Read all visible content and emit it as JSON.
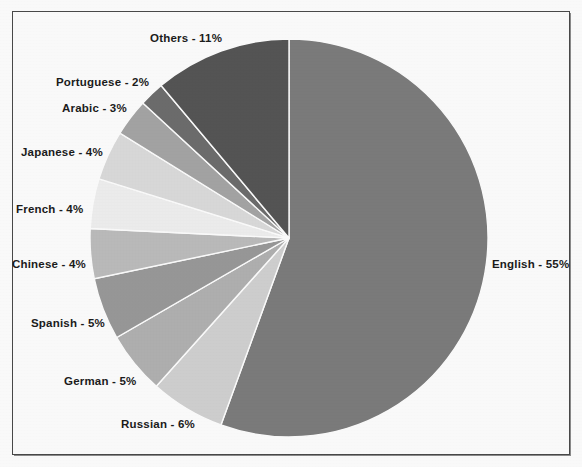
{
  "chart_data": {
    "type": "pie",
    "title": "",
    "subtitle": "",
    "xlabel": "",
    "ylabel": "",
    "legend_position": "none",
    "grid": false,
    "unit": "%",
    "start_angle_deg": 0,
    "direction": "clockwise",
    "categories": [
      "English",
      "Russian",
      "German",
      "Spanish",
      "Chinese",
      "French",
      "Japanese",
      "Arabic",
      "Portuguese",
      "Others"
    ],
    "values": [
      55,
      6,
      5,
      5,
      4,
      4,
      4,
      3,
      2,
      11
    ],
    "slices": [
      {
        "name": "English",
        "value": 55,
        "label": "English - 55%",
        "color": "#7d7d7d",
        "label_x": 492,
        "label_y": 258
      },
      {
        "name": "Russian",
        "value": 6,
        "label": "Russian - 6%",
        "color": "#d2d2d2",
        "label_x": 121,
        "label_y": 418
      },
      {
        "name": "German",
        "value": 5,
        "label": "German - 5%",
        "color": "#b2b2b2",
        "label_x": 64,
        "label_y": 375
      },
      {
        "name": "Spanish",
        "value": 5,
        "label": "Spanish - 5%",
        "color": "#9a9a9a",
        "label_x": 31,
        "label_y": 317
      },
      {
        "name": "Chinese",
        "value": 4,
        "label": "Chinese - 4%",
        "color": "#bdbdbd",
        "label_x": 12,
        "label_y": 258
      },
      {
        "name": "French",
        "value": 4,
        "label": "French  - 4%",
        "color": "#f0f0f0",
        "label_x": 16,
        "label_y": 203
      },
      {
        "name": "Japanese",
        "value": 4,
        "label": "Japanese  - 4%",
        "color": "#dcdcdc",
        "label_x": 21,
        "label_y": 146
      },
      {
        "name": "Arabic",
        "value": 3,
        "label": "Arabic - 3%",
        "color": "#a6a6a6",
        "label_x": 62,
        "label_y": 102
      },
      {
        "name": "Portuguese",
        "value": 2,
        "label": "Portuguese - 2%",
        "color": "#6e6e6e",
        "label_x": 56,
        "label_y": 76
      },
      {
        "name": "Others",
        "value": 11,
        "label": "Others - 11%",
        "color": "#565656",
        "label_x": 150,
        "label_y": 32
      }
    ],
    "geometry": {
      "cx": 289,
      "cy": 238,
      "r": 199
    }
  },
  "figure": {
    "background_color": "#ffffff",
    "border_color": "#4a4a4a",
    "label_color": "#1c1c1c"
  }
}
